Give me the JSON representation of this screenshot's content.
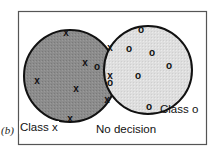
{
  "figure": {
    "panel_label": "(b)",
    "labels": {
      "class_x": "Class x",
      "class_o": "Class o",
      "no_decision": "No decision"
    },
    "colors": {
      "class_x_region": "#8a8a8a",
      "class_o_region": "#dcdcdc",
      "outline": "#111111",
      "frame": "#555555"
    },
    "regions": [
      {
        "name": "class-x-circle",
        "cx": 70,
        "cy": 76,
        "r": 46
      },
      {
        "name": "class-o-circle",
        "cx": 148,
        "cy": 70,
        "r": 44
      }
    ],
    "markers": {
      "x": [
        [
          66,
          32
        ],
        [
          85,
          62
        ],
        [
          110,
          47
        ],
        [
          37,
          80
        ],
        [
          76,
          88
        ],
        [
          110,
          75
        ],
        [
          107,
          99
        ],
        [
          70,
          118
        ]
      ],
      "o": [
        [
          141,
          29
        ],
        [
          129,
          48
        ],
        [
          152,
          52
        ],
        [
          169,
          65
        ],
        [
          138,
          75
        ],
        [
          149,
          106
        ],
        [
          97,
          66
        ],
        [
          110,
          82
        ]
      ]
    }
  }
}
